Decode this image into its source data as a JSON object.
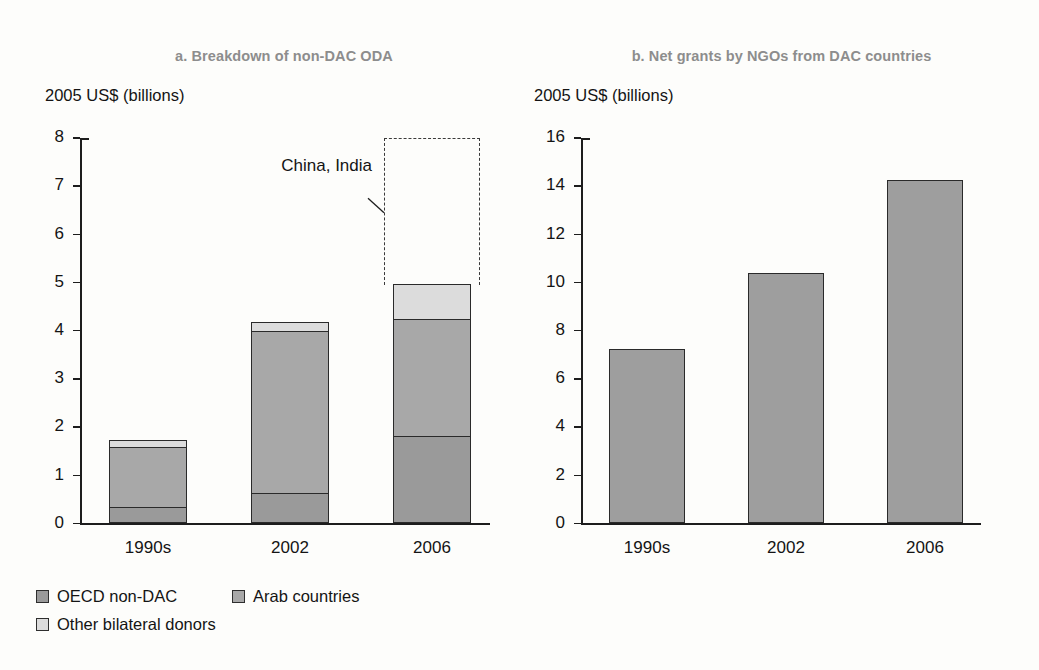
{
  "figure": {
    "background_color": "#fdfdfb",
    "title_color": "#8d8d8d"
  },
  "panel_a": {
    "title": "a. Breakdown of non-DAC ODA",
    "axis_unit": "2005 US$ (billions)",
    "annotation": {
      "label": "China, India"
    },
    "legend": {
      "items": [
        {
          "label": "OECD non-DAC",
          "color": "#9a9a9a",
          "key": "oecd"
        },
        {
          "label": "Arab countries",
          "color": "#a8a8a8",
          "key": "arab"
        },
        {
          "label": "Other bilateral donors",
          "color": "#dcdcdc",
          "key": "other"
        }
      ]
    }
  },
  "panel_b": {
    "title": "b. Net grants by NGOs from DAC countries",
    "axis_unit": "2005 US$ (billions)"
  },
  "chart_data": [
    {
      "id": "panel-a",
      "type": "bar",
      "stacked": true,
      "title": "a. Breakdown of non-DAC ODA",
      "xlabel": "",
      "ylabel": "2005 US$ (billions)",
      "ylim": [
        0,
        8
      ],
      "yticks": [
        0,
        1,
        2,
        3,
        4,
        5,
        6,
        7,
        8
      ],
      "ytick_labels": [
        "0",
        "1",
        "2",
        "3",
        "4",
        "5",
        "6",
        "7",
        "8"
      ],
      "grid": false,
      "legend_position": "below-left",
      "categories": [
        "1990s",
        "2002",
        "2006"
      ],
      "series": [
        {
          "name": "OECD non-DAC",
          "color": "#9a9a9a",
          "values": [
            0.33,
            0.62,
            1.8
          ]
        },
        {
          "name": "Arab countries",
          "color": "#a8a8a8",
          "values": [
            1.23,
            3.35,
            2.42
          ]
        },
        {
          "name": "Other bilateral donors",
          "color": "#dcdcdc",
          "values": [
            0.14,
            0.18,
            0.73
          ]
        }
      ],
      "totals": [
        1.7,
        4.15,
        4.95
      ],
      "annotations": [
        {
          "text": "China, India",
          "type": "dashed-range-box",
          "category": "2006",
          "y_from": 4.95,
          "y_to": 8.0
        }
      ]
    },
    {
      "id": "panel-b",
      "type": "bar",
      "stacked": false,
      "title": "b. Net grants by NGOs from DAC countries",
      "xlabel": "",
      "ylabel": "2005 US$ (billions)",
      "ylim": [
        0,
        16
      ],
      "yticks": [
        0,
        2,
        4,
        6,
        8,
        10,
        12,
        14,
        16
      ],
      "ytick_labels": [
        "0",
        "2",
        "4",
        "6",
        "8",
        "10",
        "12",
        "14",
        "16"
      ],
      "grid": false,
      "legend_position": "none",
      "categories": [
        "1990s",
        "2002",
        "2006"
      ],
      "values": [
        7.25,
        10.4,
        14.25
      ],
      "bar_color": "#9e9e9e"
    }
  ]
}
